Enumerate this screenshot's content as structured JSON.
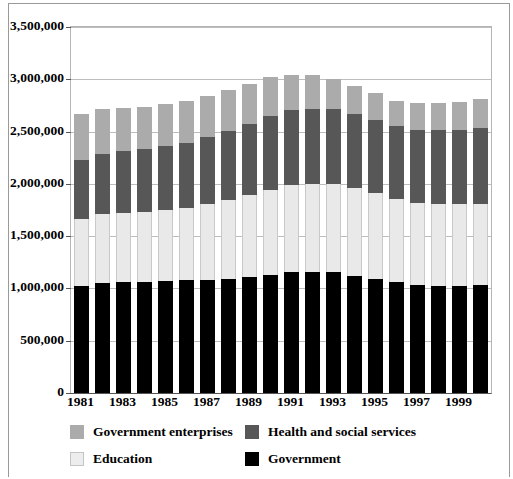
{
  "chart_data": {
    "type": "bar",
    "stacked": true,
    "title": "",
    "subtitle": "",
    "xlabel": "",
    "ylabel": "",
    "ylim": [
      0,
      3500000
    ],
    "ytick_step": 500000,
    "yticks": [
      0,
      500000,
      1000000,
      1500000,
      2000000,
      2500000,
      3000000,
      3500000
    ],
    "ytick_labels": [
      "0",
      "500,000",
      "1,000,000",
      "1,500,000",
      "2,000,000",
      "2,500,000",
      "3,000,000",
      "3,500,000"
    ],
    "grid": true,
    "grid_axis": "y",
    "legend_position": "bottom",
    "categories": [
      1981,
      1982,
      1983,
      1984,
      1985,
      1986,
      1987,
      1988,
      1989,
      1990,
      1991,
      1992,
      1993,
      1994,
      1995,
      1996,
      1997,
      1998,
      1999,
      2000
    ],
    "xtick_labels": [
      "1981",
      "",
      "1983",
      "",
      "1985",
      "",
      "1987",
      "",
      "1989",
      "",
      "1991",
      "",
      "1993",
      "",
      "1995",
      "",
      "1997",
      "",
      "1999",
      ""
    ],
    "series": [
      {
        "name": "Government",
        "color": "#000000",
        "values": [
          1020000,
          1055000,
          1060000,
          1065000,
          1070000,
          1080000,
          1085000,
          1095000,
          1105000,
          1125000,
          1155000,
          1160000,
          1155000,
          1120000,
          1090000,
          1060000,
          1030000,
          1025000,
          1025000,
          1035000
        ]
      },
      {
        "name": "Education",
        "color": "#e9e9e9",
        "values": [
          640000,
          655000,
          665000,
          670000,
          680000,
          690000,
          720000,
          750000,
          790000,
          820000,
          835000,
          840000,
          845000,
          840000,
          825000,
          800000,
          790000,
          785000,
          780000,
          775000
        ]
      },
      {
        "name": "Health and social services",
        "color": "#575757",
        "values": [
          570000,
          580000,
          590000,
          600000,
          610000,
          625000,
          640000,
          660000,
          680000,
          700000,
          715000,
          720000,
          715000,
          710000,
          700000,
          690000,
          700000,
          710000,
          715000,
          725000
        ]
      },
      {
        "name": "Government enterprises",
        "color": "#ababab",
        "values": [
          440000,
          425000,
          410000,
          405000,
          400000,
          400000,
          395000,
          390000,
          385000,
          380000,
          340000,
          320000,
          290000,
          265000,
          250000,
          245000,
          250000,
          255000,
          265000,
          275000
        ]
      }
    ],
    "totals": [
      2670000,
      2715000,
      2725000,
      2740000,
      2760000,
      2795000,
      2840000,
      2895000,
      2960000,
      3025000,
      3045000,
      3040000,
      3005000,
      2935000,
      2865000,
      2795000,
      2770000,
      2775000,
      2785000,
      2810000
    ]
  },
  "legend": {
    "items": [
      {
        "label": "Government enterprises",
        "swatch": "sw-enterprise",
        "row": 0,
        "col": 0
      },
      {
        "label": "Health and social services",
        "swatch": "sw-health",
        "row": 0,
        "col": 1
      },
      {
        "label": "Education",
        "swatch": "sw-edu",
        "row": 1,
        "col": 0
      },
      {
        "label": "Government",
        "swatch": "sw-gov",
        "row": 1,
        "col": 1
      }
    ]
  },
  "colors": {
    "government": "#000000",
    "education": "#e9e9e9",
    "health_and_social_services": "#575757",
    "government_enterprises": "#ababab",
    "gridline": "#bdbdbd",
    "axis": "#555555",
    "frame": "#9a9a9a",
    "background": "#ffffff"
  }
}
